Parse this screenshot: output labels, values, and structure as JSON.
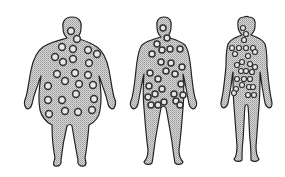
{
  "figure": {
    "colors": {
      "background": "#ffffff",
      "body_fill": "#c8c8c8",
      "outline": "#222222",
      "marker_stroke": "#333333",
      "marker_fill": "#e8e8e8"
    },
    "figures": [
      {
        "name": "obese-figure",
        "markers": [
          [
            71,
            31
          ],
          [
            77,
            39
          ],
          [
            62,
            47
          ],
          [
            73,
            49
          ],
          [
            88,
            50
          ],
          [
            97,
            54
          ],
          [
            55,
            57
          ],
          [
            63,
            62
          ],
          [
            73,
            59
          ],
          [
            89,
            63
          ],
          [
            57,
            74
          ],
          [
            65,
            81
          ],
          [
            75,
            73
          ],
          [
            88,
            75
          ],
          [
            48,
            86
          ],
          [
            79,
            84
          ],
          [
            93,
            85
          ],
          [
            76,
            94
          ],
          [
            48,
            100
          ],
          [
            62,
            100
          ],
          [
            94,
            99
          ],
          [
            49,
            114
          ],
          [
            65,
            111
          ],
          [
            78,
            112
          ],
          [
            92,
            110
          ]
        ]
      },
      {
        "name": "overweight-figure",
        "markers": [
          [
            163,
            28
          ],
          [
            167,
            38
          ],
          [
            157,
            44
          ],
          [
            162,
            50
          ],
          [
            170,
            49
          ],
          [
            180,
            49
          ],
          [
            152,
            54
          ],
          [
            161,
            62
          ],
          [
            171,
            63
          ],
          [
            182,
            67
          ],
          [
            150,
            73
          ],
          [
            166,
            71
          ],
          [
            175,
            74
          ],
          [
            158,
            79
          ],
          [
            181,
            84
          ],
          [
            149,
            86
          ],
          [
            162,
            89
          ],
          [
            174,
            94
          ],
          [
            148,
            97
          ],
          [
            155,
            94
          ],
          [
            164,
            102
          ],
          [
            176,
            101
          ],
          [
            183,
            95
          ],
          [
            151,
            105
          ],
          [
            158,
            105
          ],
          [
            180,
            105
          ]
        ]
      },
      {
        "name": "lean-figure",
        "markers": [
          [
            243,
            28
          ],
          [
            246,
            34
          ],
          [
            244,
            40
          ],
          [
            232,
            48
          ],
          [
            239,
            48
          ],
          [
            246,
            48
          ],
          [
            253,
            48
          ],
          [
            235,
            54
          ],
          [
            248,
            56
          ],
          [
            255,
            52
          ],
          [
            237,
            65
          ],
          [
            242,
            62
          ],
          [
            250,
            64
          ],
          [
            255,
            67
          ],
          [
            241,
            71
          ],
          [
            246,
            71
          ],
          [
            252,
            72
          ],
          [
            237,
            79
          ],
          [
            244,
            79
          ],
          [
            250,
            79
          ],
          [
            236,
            89
          ],
          [
            242,
            85
          ],
          [
            249,
            87
          ],
          [
            253,
            87
          ],
          [
            234,
            93
          ],
          [
            248,
            95
          ],
          [
            254,
            95
          ]
        ]
      }
    ]
  }
}
